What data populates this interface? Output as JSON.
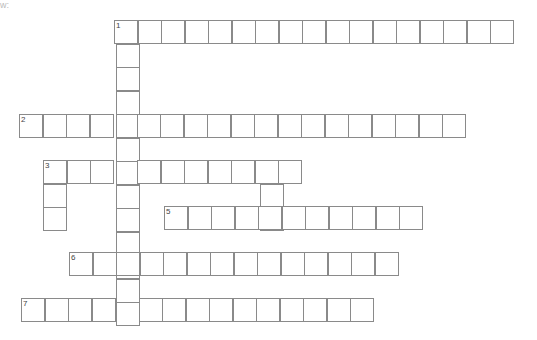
{
  "puzzle": {
    "type": "crossword",
    "cell_size": 24,
    "clue_numbers": [
      "1",
      "2",
      "3",
      "4",
      "5",
      "6",
      "7"
    ],
    "entries": [
      {
        "number": "1",
        "direction": "across",
        "x": 114,
        "y": 20,
        "length": 17
      },
      {
        "number": "1",
        "direction": "down",
        "x": 116,
        "y": 20,
        "length": 13
      },
      {
        "number": "2",
        "direction": "across",
        "x": 19,
        "y": 114,
        "length": 19
      },
      {
        "number": "3",
        "direction": "across",
        "x": 43,
        "y": 160,
        "length": 11
      },
      {
        "number": "3",
        "direction": "down",
        "x": 43,
        "y": 160,
        "length": 3
      },
      {
        "number": "4",
        "direction": "down",
        "x": 260,
        "y": 160,
        "length": 3
      },
      {
        "number": "5",
        "direction": "across",
        "x": 164,
        "y": 206,
        "length": 11
      },
      {
        "number": "6",
        "direction": "across",
        "x": 69,
        "y": 252,
        "length": 14
      },
      {
        "number": "7",
        "direction": "across",
        "x": 21,
        "y": 298,
        "length": 15
      }
    ]
  },
  "header_fragment": "w:"
}
